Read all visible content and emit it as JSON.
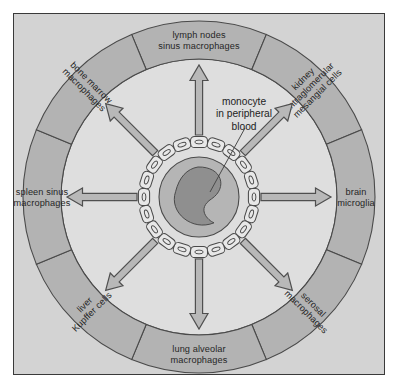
{
  "figure": {
    "center_label": {
      "lines": [
        "monocyte",
        "in peripheral",
        "blood"
      ]
    },
    "colors": {
      "page_background": "#ffffff",
      "panel_background": "#d3d3d3",
      "panel_border": "#3a3a3a",
      "outer_ring_fill": "#b3b3b3",
      "inner_disc_fill": "#dedede",
      "ring_outline": "#4a4a4a",
      "arrow_fill": "#b8b8b8",
      "arrow_outline": "#4f4f4f",
      "cytoplasm_fill": "#b5b5b5",
      "nucleus_fill": "#8f8f8f",
      "endothelial_fill": "#e8e8e8",
      "text_color": "#262626"
    },
    "segments": [
      {
        "id": "lymph-nodes",
        "lines": [
          "lymph nodes",
          "sinus macrophages"
        ],
        "center_angle_deg": -90,
        "start_angle_deg": -112.5,
        "end_angle_deg": -67.5,
        "orientation": "horizontal"
      },
      {
        "id": "kidney",
        "lines": [
          "kidney",
          "intraglomerular",
          "mesangial cells"
        ],
        "center_angle_deg": -45,
        "start_angle_deg": -67.5,
        "end_angle_deg": -22.5,
        "orientation": "radial"
      },
      {
        "id": "brain",
        "lines": [
          "brain",
          "microglia"
        ],
        "center_angle_deg": 0,
        "start_angle_deg": -22.5,
        "end_angle_deg": 22.5,
        "orientation": "radial"
      },
      {
        "id": "serosal",
        "lines": [
          "serosal",
          "macrophages"
        ],
        "center_angle_deg": 45,
        "start_angle_deg": 22.5,
        "end_angle_deg": 67.5,
        "orientation": "radial"
      },
      {
        "id": "lung",
        "lines": [
          "lung alveolar",
          "macrophages"
        ],
        "center_angle_deg": 90,
        "start_angle_deg": 67.5,
        "end_angle_deg": 112.5,
        "orientation": "horizontal"
      },
      {
        "id": "liver",
        "lines": [
          "liver",
          "Kupffer cells"
        ],
        "center_angle_deg": 135,
        "start_angle_deg": 112.5,
        "end_angle_deg": 157.5,
        "orientation": "radial"
      },
      {
        "id": "spleen",
        "lines": [
          "spleen sinus",
          "macrophages"
        ],
        "center_angle_deg": 180,
        "start_angle_deg": 157.5,
        "end_angle_deg": 202.5,
        "orientation": "radial"
      },
      {
        "id": "bone-marrow",
        "lines": [
          "bone marrow",
          "macrophages"
        ],
        "center_angle_deg": 225,
        "start_angle_deg": 202.5,
        "end_angle_deg": 247.5,
        "orientation": "radial"
      }
    ],
    "arrows": [
      {
        "id": "arrow-lymph-nodes",
        "angle_deg": -90
      },
      {
        "id": "arrow-kidney",
        "angle_deg": -45
      },
      {
        "id": "arrow-brain",
        "angle_deg": 0
      },
      {
        "id": "arrow-serosal",
        "angle_deg": 45
      },
      {
        "id": "arrow-lung",
        "angle_deg": 90
      },
      {
        "id": "arrow-liver",
        "angle_deg": 135
      },
      {
        "id": "arrow-spleen",
        "angle_deg": 180
      },
      {
        "id": "arrow-bone-marrow",
        "angle_deg": 225
      }
    ],
    "geometry": {
      "center_x": 199,
      "center_y": 197,
      "outer_ring_outer_radius": 176,
      "outer_ring_inner_radius": 138,
      "arrow_tail_radius": 62,
      "arrow_tip_radius": 132,
      "endothelial_ring_radius": 55,
      "monocyte_radius": 40,
      "nucleus_radius": 30,
      "endothelial_cell_count": 20
    }
  }
}
